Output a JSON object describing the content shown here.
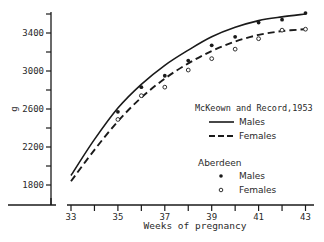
{
  "chart_data": {
    "type": "line",
    "title": "",
    "xlabel": "Weeks of pregnancy",
    "ylabel": "g",
    "xlim": [
      33,
      43
    ],
    "ylim": [
      1600,
      3600
    ],
    "x_ticks": [
      33,
      34,
      35,
      36,
      37,
      38,
      39,
      40,
      41,
      42,
      43
    ],
    "x_tick_labels": [
      "33",
      "",
      "35",
      "",
      "37",
      "",
      "39",
      "",
      "41",
      "",
      "43"
    ],
    "y_ticks": [
      1800,
      2000,
      2200,
      2400,
      2600,
      2800,
      3000,
      3200,
      3400,
      3600
    ],
    "y_tick_labels": [
      "1800",
      "",
      "2200",
      "",
      "2600",
      "",
      "3000",
      "",
      "3400",
      ""
    ],
    "grid": false,
    "legend_position": "lower right (inside)",
    "legend_groups": [
      {
        "title": "McKeown and Record,1953",
        "entries": [
          {
            "label": "Males",
            "style": "solid-line"
          },
          {
            "label": "Females",
            "style": "dashed-line"
          }
        ]
      },
      {
        "title": "Aberdeen",
        "entries": [
          {
            "label": "Males",
            "style": "filled-dot"
          },
          {
            "label": "Females",
            "style": "open-circle"
          }
        ]
      }
    ],
    "series": [
      {
        "name": "McKeown and Record, 1953 - Males",
        "kind": "curve",
        "style": "solid",
        "x": [
          33,
          34,
          35,
          36,
          37,
          38,
          39,
          40,
          41,
          42,
          43
        ],
        "values": [
          1900,
          2280,
          2610,
          2860,
          3060,
          3220,
          3360,
          3460,
          3530,
          3570,
          3600
        ]
      },
      {
        "name": "McKeown and Record, 1953 - Females",
        "kind": "curve",
        "style": "dashed",
        "x": [
          33,
          34,
          35,
          36,
          37,
          38,
          39,
          40,
          41,
          42,
          43
        ],
        "values": [
          1840,
          2170,
          2470,
          2720,
          2920,
          3080,
          3210,
          3310,
          3380,
          3420,
          3440
        ]
      },
      {
        "name": "Aberdeen - Males",
        "kind": "points",
        "style": "filled",
        "x": [
          35,
          36,
          37,
          38,
          39,
          40,
          41,
          42,
          43
        ],
        "values": [
          2570,
          2830,
          2950,
          3110,
          3270,
          3360,
          3510,
          3540,
          3610
        ]
      },
      {
        "name": "Aberdeen - Females",
        "kind": "points",
        "style": "open",
        "x": [
          35,
          36,
          37,
          38,
          39,
          40,
          41,
          42,
          43
        ],
        "values": [
          2490,
          2740,
          2830,
          3010,
          3130,
          3230,
          3340,
          3430,
          3440
        ]
      }
    ]
  },
  "labels": {
    "y_unit": "g",
    "x_axis_title": "Weeks of pregnancy",
    "legend_group1_title": "McKeown and Record,1953",
    "legend_group1_males": "Males",
    "legend_group1_females": "Females",
    "legend_group2_title": "Aberdeen",
    "legend_group2_males": "Males",
    "legend_group2_females": "Females"
  },
  "colors": {
    "ink": "#1a1a1a",
    "background": "#ffffff"
  }
}
